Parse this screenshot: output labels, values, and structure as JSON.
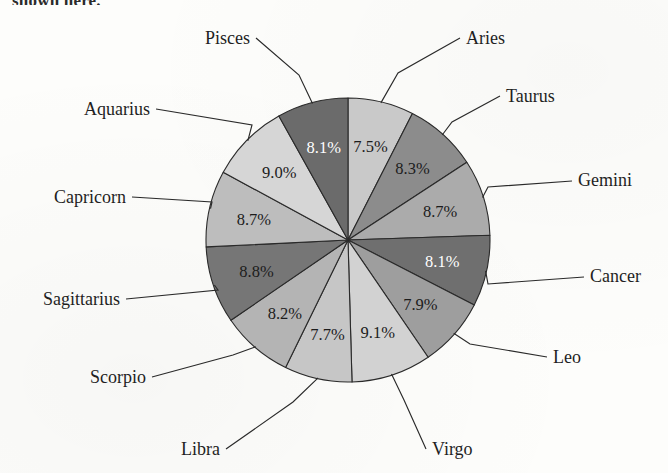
{
  "page": {
    "truncated_caption": "shown here.",
    "background_color": "#fdfdfb"
  },
  "chart_data": {
    "type": "pie",
    "title": "",
    "subtitle": "",
    "xlabel": "",
    "ylabel": "",
    "units": "percent",
    "start_angle_deg": 0,
    "direction": "clockwise",
    "legend_position": "none",
    "labels_outside_with_leader_lines": true,
    "grid": false,
    "center": {
      "x": 348,
      "y": 240
    },
    "radius": 142,
    "categories": [
      "Aries",
      "Taurus",
      "Gemini",
      "Cancer",
      "Leo",
      "Virgo",
      "Libra",
      "Scorpio",
      "Sagittarius",
      "Capricorn",
      "Aquarius",
      "Pisces"
    ],
    "values": [
      7.5,
      8.3,
      8.7,
      8.1,
      7.9,
      9.1,
      7.7,
      8.2,
      8.8,
      8.7,
      9.0,
      8.1
    ],
    "value_labels": [
      "7.5%",
      "8.3%",
      "8.7%",
      "8.1%",
      "7.9%",
      "9.1%",
      "7.7%",
      "8.2%",
      "8.8%",
      "8.7%",
      "9.0%",
      "8.1%"
    ],
    "slice_colors": [
      "#c9c9c9",
      "#8c8c8c",
      "#ababab",
      "#6f6f6f",
      "#9e9e9e",
      "#d2d2d2",
      "#c6c6c6",
      "#b4b4b4",
      "#767676",
      "#bdbdbd",
      "#d6d6d6",
      "#6b6b6b"
    ],
    "slice_label_colors": [
      "#1c1c1c",
      "#1c1c1c",
      "#1c1c1c",
      "#ffffff",
      "#1c1c1c",
      "#1c1c1c",
      "#1c1c1c",
      "#1c1c1c",
      "#1c1c1c",
      "#1c1c1c",
      "#1c1c1c",
      "#ffffff"
    ],
    "slices": [
      {
        "label": "Aries",
        "value": 7.5,
        "value_label": "7.5%",
        "color": "#c9c9c9",
        "text_color": "#1c1c1c",
        "label_side": "right"
      },
      {
        "label": "Taurus",
        "value": 8.3,
        "value_label": "8.3%",
        "color": "#8c8c8c",
        "text_color": "#1c1c1c",
        "label_side": "right"
      },
      {
        "label": "Gemini",
        "value": 8.7,
        "value_label": "8.7%",
        "color": "#ababab",
        "text_color": "#1c1c1c",
        "label_side": "right"
      },
      {
        "label": "Cancer",
        "value": 8.1,
        "value_label": "8.1%",
        "color": "#6f6f6f",
        "text_color": "#ffffff",
        "label_side": "right"
      },
      {
        "label": "Leo",
        "value": 7.9,
        "value_label": "7.9%",
        "color": "#9e9e9e",
        "text_color": "#1c1c1c",
        "label_side": "right"
      },
      {
        "label": "Virgo",
        "value": 9.1,
        "value_label": "9.1%",
        "color": "#d2d2d2",
        "text_color": "#1c1c1c",
        "label_side": "bottom-right"
      },
      {
        "label": "Libra",
        "value": 7.7,
        "value_label": "7.7%",
        "color": "#c6c6c6",
        "text_color": "#1c1c1c",
        "label_side": "bottom-left"
      },
      {
        "label": "Scorpio",
        "value": 8.2,
        "value_label": "8.2%",
        "color": "#b4b4b4",
        "text_color": "#1c1c1c",
        "label_side": "left"
      },
      {
        "label": "Sagittarius",
        "value": 8.8,
        "value_label": "8.8%",
        "color": "#767676",
        "text_color": "#1c1c1c",
        "label_side": "left"
      },
      {
        "label": "Capricorn",
        "value": 8.7,
        "value_label": "8.7%",
        "color": "#bdbdbd",
        "text_color": "#1c1c1c",
        "label_side": "left"
      },
      {
        "label": "Aquarius",
        "value": 9.0,
        "value_label": "9.0%",
        "color": "#d6d6d6",
        "text_color": "#1c1c1c",
        "label_side": "left"
      },
      {
        "label": "Pisces",
        "value": 8.1,
        "value_label": "8.1%",
        "color": "#6b6b6b",
        "text_color": "#ffffff",
        "label_side": "top-left"
      }
    ]
  },
  "labels": {
    "aries": "Aries",
    "taurus": "Taurus",
    "gemini": "Gemini",
    "cancer": "Cancer",
    "leo": "Leo",
    "virgo": "Virgo",
    "libra": "Libra",
    "scorpio": "Scorpio",
    "sagittarius": "Sagittarius",
    "capricorn": "Capricorn",
    "aquarius": "Aquarius",
    "pisces": "Pisces"
  }
}
